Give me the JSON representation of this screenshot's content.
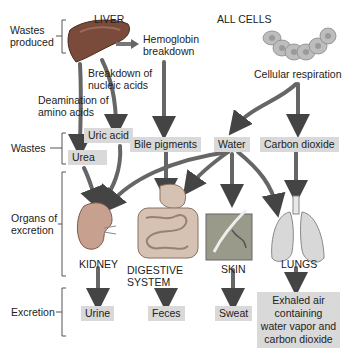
{
  "diagram": {
    "row_labels": {
      "wastes_produced": "Wastes\nproduced",
      "wastes": "Wastes",
      "organs": "Organs of\nexcretion",
      "excretion": "Excretion"
    },
    "sources": {
      "liver": "LIVER",
      "all_cells": "ALL CELLS",
      "hemoglobin": "Hemoglobin\nbreakdown",
      "nucleic": "Breakdown of\nnucleic acids",
      "deamination": "Deamination of\namino acids",
      "respiration": "Cellular respiration"
    },
    "wastes": {
      "uric_acid": "Uric acid",
      "urea": "Urea",
      "bile": "Bile pigments",
      "water": "Water",
      "co2": "Carbon dioxide"
    },
    "organs": {
      "kidney": "KIDNEY",
      "digestive": "DIGESTIVE\nSYSTEM",
      "skin": "SKIN",
      "lungs": "LUNGS"
    },
    "excretion": {
      "urine": "Urine",
      "feces": "Feces",
      "sweat": "Sweat",
      "exhaled": "Exhaled air\ncontaining\nwater vapor and\ncarbon dioxide"
    },
    "colors": {
      "box_fill": "#d9d9d9",
      "arrow": "#555555",
      "liver": "#7a4a3a",
      "cells": "#b5b5b5"
    }
  }
}
